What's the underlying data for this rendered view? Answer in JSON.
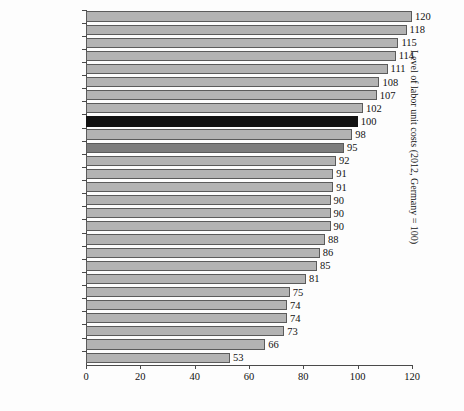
{
  "chart": {
    "type": "bar",
    "orientation": "horizontal",
    "background_color": "#fdfdfd",
    "bar_color": "#b3b3b3",
    "bar_edge_color": "#5b5b5b",
    "highlight_color": "#121212",
    "average_color": "#7d7d7d"
  },
  "axis": {
    "right_title": "Level of labor unit costs (2012, Germany = 100)",
    "x_ticks": [
      "0",
      "20",
      "40",
      "60",
      "80",
      "100",
      "120"
    ],
    "x_tick_values": [
      0,
      20,
      40,
      60,
      80,
      100,
      120
    ],
    "x_min": 0,
    "x_max": 120
  },
  "chart_data": {
    "type": "bar",
    "orientation": "horizontal",
    "title": "",
    "subtitle": "",
    "xlabel": "",
    "ylabel": "Level of labor unit costs (2012, Germany = 100)",
    "xlim": [
      0,
      120
    ],
    "grid": false,
    "legend": null,
    "value_labels": true,
    "categories": [
      "UK",
      "Italy",
      "France",
      "Belgium",
      "Denmark",
      "Finland",
      "Norway",
      "Slovenia",
      "Germany",
      "Cyprus",
      "Average",
      "Austria",
      "Canada",
      "Netherlands",
      "Sweden",
      "Japan",
      "Estonia",
      "Czech Republic",
      "Portugal",
      "Spain",
      "US",
      "Greece",
      "Hungary",
      "Slovakia",
      "Poland",
      "Latvia",
      "Lithuania"
    ],
    "values": [
      120,
      118,
      115,
      114,
      111,
      108,
      107,
      102,
      100,
      98,
      95,
      92,
      91,
      91,
      90,
      90,
      90,
      88,
      86,
      85,
      81,
      75,
      74,
      74,
      73,
      66,
      53
    ],
    "series": [
      {
        "name": "Level of labor unit costs",
        "values": [
          120,
          118,
          115,
          114,
          111,
          108,
          107,
          102,
          100,
          98,
          95,
          92,
          91,
          91,
          90,
          90,
          90,
          88,
          86,
          85,
          81,
          75,
          74,
          74,
          73,
          66,
          53
        ]
      }
    ],
    "highlighted_categories": [
      "Germany"
    ],
    "average_category": "Average"
  }
}
